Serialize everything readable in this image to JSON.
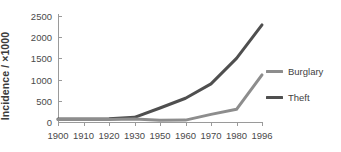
{
  "chart_data": {
    "type": "line",
    "title": "",
    "xlabel": "",
    "ylabel": "Incidence / ×1000",
    "x": [
      1900,
      1910,
      1920,
      1930,
      1950,
      1960,
      1970,
      1980,
      1996
    ],
    "categories": [
      "1900",
      "1910",
      "1920",
      "1930",
      "1950",
      "1960",
      "1970",
      "1980",
      "1996"
    ],
    "xtick_labels": [
      "1900",
      "1910",
      "1920",
      "1930",
      "1950",
      "1960",
      "1970",
      "1980",
      "1996"
    ],
    "ytick_labels": [
      "0",
      "500",
      "1000",
      "1500",
      "2000",
      "2500"
    ],
    "ytick_values": [
      0,
      500,
      1000,
      1500,
      2000,
      2500
    ],
    "ylim": [
      0,
      2500
    ],
    "grid": false,
    "legend_position": "right",
    "series": [
      {
        "name": "Burglary",
        "color": "#8d8d8d",
        "values": [
          60,
          60,
          60,
          70,
          40,
          45,
          180,
          300,
          1110
        ]
      },
      {
        "name": "Theft",
        "color": "#4f4f4f",
        "values": [
          70,
          70,
          75,
          110,
          330,
          560,
          900,
          1500,
          2290
        ]
      }
    ]
  },
  "legend": {
    "items": [
      {
        "label": "Burglary",
        "color": "#8d8d8d"
      },
      {
        "label": "Theft",
        "color": "#4f4f4f"
      }
    ]
  },
  "axes": {
    "y_title": "Incidence / ×1000"
  }
}
